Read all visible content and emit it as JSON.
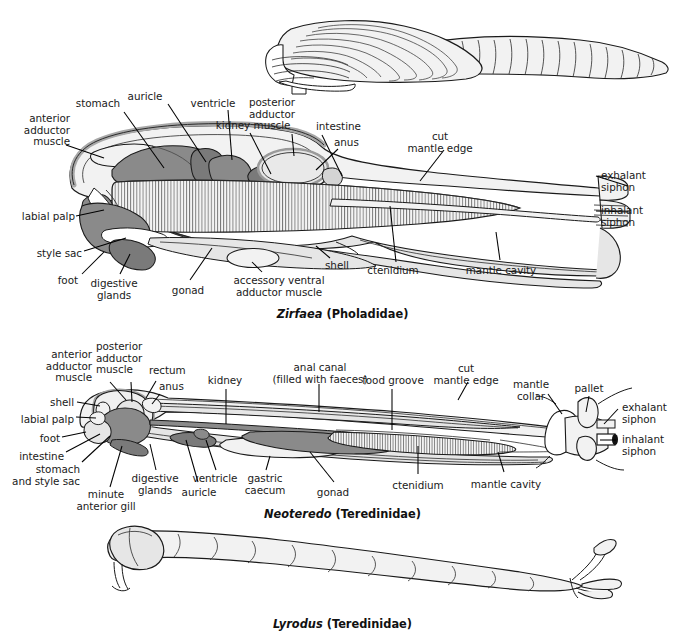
{
  "figure": {
    "background_color": "#ffffff",
    "line_color": "#1a1a1a",
    "tones": {
      "body_pale": "#f2f2f2",
      "body_light": "#e6e6e6",
      "organ_mid": "#bdbdbd",
      "organ_dark": "#8a8a8a"
    }
  },
  "panels": [
    {
      "id": "panel-shell-top",
      "caption": null,
      "description": "Whole-animal external view of Zirfaea shell with elongated siphon",
      "labels": []
    },
    {
      "id": "panel-zirfaea",
      "caption": {
        "genus": "Zirfaea",
        "family": "(Pholadidae)"
      },
      "labels": [
        {
          "id": "anterior-adductor-muscle",
          "text": [
            "anterior",
            "adductor",
            "muscle"
          ],
          "align": "right",
          "x": 18,
          "y": 118
        },
        {
          "id": "stomach",
          "text": [
            "stomach"
          ],
          "align": "center",
          "x": 98,
          "y": 100
        },
        {
          "id": "auricle",
          "text": [
            "auricle"
          ],
          "align": "center",
          "x": 145,
          "y": 93
        },
        {
          "id": "ventricle",
          "text": [
            "ventricle"
          ],
          "align": "center",
          "x": 213,
          "y": 100
        },
        {
          "id": "kidney",
          "text": [
            "kidney"
          ],
          "align": "center",
          "x": 233,
          "y": 122
        },
        {
          "id": "posterior-adductor-muscle",
          "text": [
            "posterior",
            "adductor",
            "muscle"
          ],
          "align": "center",
          "x": 272,
          "y": 99
        },
        {
          "id": "intestine",
          "text": [
            "intestine"
          ],
          "align": "left",
          "x": 318,
          "y": 123
        },
        {
          "id": "anus",
          "text": [
            "anus"
          ],
          "align": "left",
          "x": 334,
          "y": 140
        },
        {
          "id": "cut-mantle-edge",
          "text": [
            "cut",
            "mantle edge"
          ],
          "align": "center",
          "x": 437,
          "y": 135
        },
        {
          "id": "exhalant-siphon",
          "text": [
            "exhalant",
            "siphon"
          ],
          "align": "left",
          "x": 601,
          "y": 172
        },
        {
          "id": "inhalant-siphon",
          "text": [
            "inhalant",
            "siphon"
          ],
          "align": "left",
          "x": 601,
          "y": 207
        },
        {
          "id": "labial-palp",
          "text": [
            "labial palp"
          ],
          "align": "right",
          "x": 22,
          "y": 214
        },
        {
          "id": "style-sac",
          "text": [
            "style sac"
          ],
          "align": "right",
          "x": 32,
          "y": 251
        },
        {
          "id": "foot",
          "text": [
            "foot"
          ],
          "align": "right",
          "x": 58,
          "y": 278
        },
        {
          "id": "digestive-glands",
          "text": [
            "digestive",
            "glands"
          ],
          "align": "center",
          "x": 113,
          "y": 281
        },
        {
          "id": "gonad",
          "text": [
            "gonad"
          ],
          "align": "center",
          "x": 188,
          "y": 288
        },
        {
          "id": "accessory-ventral-adductor-muscle",
          "text": [
            "accessory ventral",
            "adductor muscle"
          ],
          "align": "center",
          "x": 279,
          "y": 278
        },
        {
          "id": "shell",
          "text": [
            "shell"
          ],
          "align": "left",
          "x": 325,
          "y": 263
        },
        {
          "id": "ctenidium",
          "text": [
            "ctenidium"
          ],
          "align": "center",
          "x": 393,
          "y": 268
        },
        {
          "id": "mantle-cavity",
          "text": [
            "mantle cavity"
          ],
          "align": "center",
          "x": 501,
          "y": 268
        }
      ]
    },
    {
      "id": "panel-neoteredo",
      "caption": {
        "genus": "Neoteredo",
        "family": "(Teredinidae)"
      },
      "labels": [
        {
          "id": "anterior-adductor-muscle",
          "text": [
            "anterior",
            "adductor",
            "muscle"
          ],
          "align": "right",
          "x": 92,
          "y": 352
        },
        {
          "id": "posterior-adductor-muscle",
          "text": [
            "posterior",
            "adductor",
            "muscle"
          ],
          "align": "left",
          "x": 98,
          "y": 344
        },
        {
          "id": "rectum",
          "text": [
            "rectum"
          ],
          "align": "left",
          "x": 150,
          "y": 367
        },
        {
          "id": "anus",
          "text": [
            "anus"
          ],
          "align": "left",
          "x": 160,
          "y": 384
        },
        {
          "id": "kidney",
          "text": [
            "kidney"
          ],
          "align": "center",
          "x": 223,
          "y": 377
        },
        {
          "id": "anal-canal",
          "text": [
            "anal canal",
            "(filled with faeces)"
          ],
          "align": "center",
          "x": 319,
          "y": 364
        },
        {
          "id": "food-groove",
          "text": [
            "food groove"
          ],
          "align": "center",
          "x": 392,
          "y": 377
        },
        {
          "id": "cut-mantle-edge",
          "text": [
            "cut",
            "mantle edge"
          ],
          "align": "center",
          "x": 464,
          "y": 366
        },
        {
          "id": "mantle-collar",
          "text": [
            "mantle",
            "collar"
          ],
          "align": "center",
          "x": 531,
          "y": 381
        },
        {
          "id": "pallet",
          "text": [
            "pallet"
          ],
          "align": "center",
          "x": 589,
          "y": 385
        },
        {
          "id": "exhalant-siphon",
          "text": [
            "exhalant",
            "siphon"
          ],
          "align": "left",
          "x": 622,
          "y": 404
        },
        {
          "id": "inhalant-siphon",
          "text": [
            "inhalant",
            "siphon"
          ],
          "align": "left",
          "x": 622,
          "y": 436
        },
        {
          "id": "shell",
          "text": [
            "shell"
          ],
          "align": "right",
          "x": 60,
          "y": 400
        },
        {
          "id": "labial-palp",
          "text": [
            "labial palp"
          ],
          "align": "right",
          "x": 22,
          "y": 418
        },
        {
          "id": "foot",
          "text": [
            "foot"
          ],
          "align": "right",
          "x": 43,
          "y": 437
        },
        {
          "id": "intestine",
          "text": [
            "intestine"
          ],
          "align": "right",
          "x": 28,
          "y": 455
        },
        {
          "id": "stomach-and-style-sac",
          "text": [
            "stomach",
            "and style sac"
          ],
          "align": "right",
          "x": 30,
          "y": 468
        },
        {
          "id": "minute-anterior-gill",
          "text": [
            "minute",
            "anterior gill"
          ],
          "align": "center",
          "x": 105,
          "y": 496
        },
        {
          "id": "digestive-glands",
          "text": [
            "digestive",
            "glands"
          ],
          "align": "center",
          "x": 155,
          "y": 480
        },
        {
          "id": "auricle",
          "text": [
            "auricle"
          ],
          "align": "center",
          "x": 198,
          "y": 491
        },
        {
          "id": "ventricle",
          "text": [
            "ventricle"
          ],
          "align": "center",
          "x": 214,
          "y": 480
        },
        {
          "id": "gastric-caecum",
          "text": [
            "gastric",
            "caecum"
          ],
          "align": "center",
          "x": 264,
          "y": 480
        },
        {
          "id": "gonad",
          "text": [
            "gonad"
          ],
          "align": "center",
          "x": 331,
          "y": 490
        },
        {
          "id": "ctenidium",
          "text": [
            "ctenidium"
          ],
          "align": "center",
          "x": 417,
          "y": 483
        },
        {
          "id": "mantle-cavity",
          "text": [
            "mantle cavity"
          ],
          "align": "center",
          "x": 506,
          "y": 482
        }
      ]
    },
    {
      "id": "panel-lyrodus",
      "caption": {
        "genus": "Lyrodus",
        "family": "(Teredinidae)"
      },
      "description": "Whole-animal external view of Lyrodus worm-like body with pallets at posterior end",
      "labels": []
    }
  ]
}
